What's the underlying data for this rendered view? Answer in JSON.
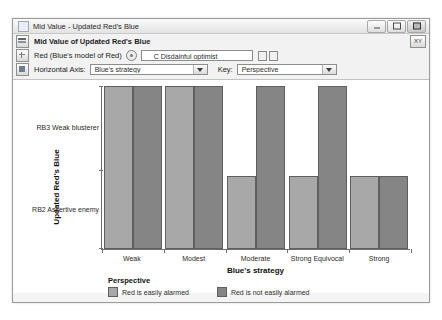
{
  "window": {
    "title": "Mid Value - Updated Red's Blue",
    "icon": "window-icon",
    "buttons": {
      "minimize": "minimize-button",
      "maximize": "maximize-button",
      "close": "close-button"
    }
  },
  "toolbar": {
    "header_title": "Mid Value of Updated Red's Blue",
    "xy_button": "XY",
    "row_red": {
      "label": "Red (Blue's model of Red)",
      "spinner": "spinner-icon",
      "value": "C Disdainful optimist",
      "placeholder": "C Disdainful optimist"
    },
    "row_axis": {
      "horizontal_axis_label": "Horizontal Axis:",
      "horizontal_axis_value": "Blue's strategy",
      "key_label": "Key:",
      "key_value": "Perspective"
    }
  },
  "chart_data": {
    "type": "bar",
    "title": "Mid Value of Updated Red's Blue",
    "xlabel": "Blue's strategy",
    "ylabel": "Updated Red's Blue",
    "categories": [
      "Weak",
      "Modest",
      "Moderate",
      "Strong Equivocal",
      "Strong"
    ],
    "ytick_labels": [
      "RB3 Weak blusterer",
      "RB2 Assertive enemy"
    ],
    "ytick_positions_pct": [
      68,
      18
    ],
    "ylim": [
      0,
      1
    ],
    "grid": false,
    "legend_position": "bottom-left",
    "legend_title": "Perspective",
    "series": [
      {
        "name": "Red is easily alarmed",
        "color": "#a8a8a8",
        "values": [
          1.0,
          1.0,
          0.45,
          0.45,
          0.45
        ]
      },
      {
        "name": "Red is not easily alarmed",
        "color": "#858585",
        "values": [
          1.0,
          1.0,
          1.0,
          1.0,
          0.45
        ]
      }
    ]
  }
}
